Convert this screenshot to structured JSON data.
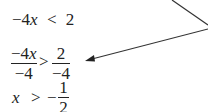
{
  "steps": {
    "line1": {
      "coef": "−4",
      "var": "x",
      "op": "<",
      "rhs": "2"
    },
    "line2": {
      "lhs_num_coef": "−4",
      "lhs_num_var": "x",
      "lhs_den": "−4",
      "op": ">",
      "rhs_num": "2",
      "rhs_den": "−4"
    },
    "line3": {
      "var": "x",
      "op": ">",
      "sign": "−",
      "rhs_num": "1",
      "rhs_den": "2"
    }
  },
  "annotation": {
    "arrow_color": "#333333",
    "pointer_target": "line2"
  }
}
